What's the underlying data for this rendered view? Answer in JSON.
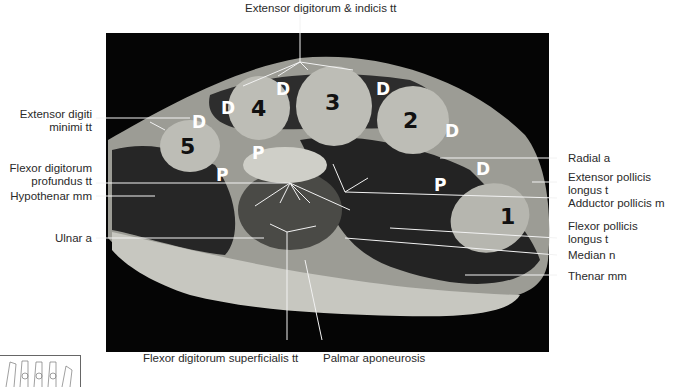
{
  "figure": {
    "labels": {
      "top": "Extensor digitorum & indicis tt",
      "extensor_digiti_minimi_1": "Extensor digiti",
      "extensor_digiti_minimi_2": "minimi tt",
      "fdp_1": "Flexor digitorum",
      "fdp_2": "profundus tt",
      "hypothenar": "Hypothenar mm",
      "ulnar": "Ulnar a",
      "radial": "Radial a",
      "epl_1": "Extensor pollicis",
      "epl_2": "longus t",
      "adductor": "Adductor pollicis m",
      "fpl_1": "Flexor pollicis",
      "fpl_2": "longus t",
      "median": "Median n",
      "thenar": "Thenar mm",
      "fds": "Flexor digitorum superficialis tt",
      "palmar": "Palmar aponeurosis"
    },
    "metacarpals": [
      "1",
      "2",
      "3",
      "4",
      "5"
    ],
    "interosseous_marks": {
      "dorsal": "D",
      "palmar": "P"
    },
    "colors": {
      "background": "#050505",
      "bone": "#b9b9b2",
      "muscle": "#262626",
      "fat": "#cfcfc8",
      "leader": "#f0f0f0"
    }
  }
}
